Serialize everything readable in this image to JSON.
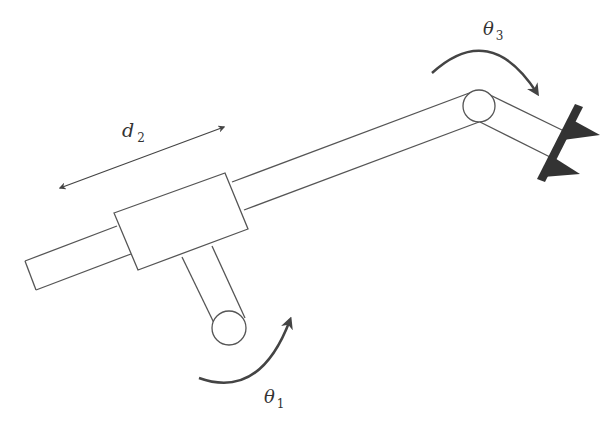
{
  "diagram": {
    "type": "robot-manipulator-schematic",
    "colors": {
      "line": "#555555",
      "arrow": "#444444",
      "gripper": "#333333",
      "background": "#ffffff"
    },
    "labels": {
      "theta1": {
        "symbol": "θ",
        "subscript": "1"
      },
      "d2": {
        "symbol": "d",
        "subscript": "2"
      },
      "theta3": {
        "symbol": "θ",
        "subscript": "3"
      }
    },
    "joints": [
      {
        "name": "base-revolute-joint",
        "variable": "θ1",
        "kind": "revolute"
      },
      {
        "name": "prismatic-joint",
        "variable": "d2",
        "kind": "prismatic"
      },
      {
        "name": "wrist-revolute-joint",
        "variable": "θ3",
        "kind": "revolute"
      }
    ]
  }
}
